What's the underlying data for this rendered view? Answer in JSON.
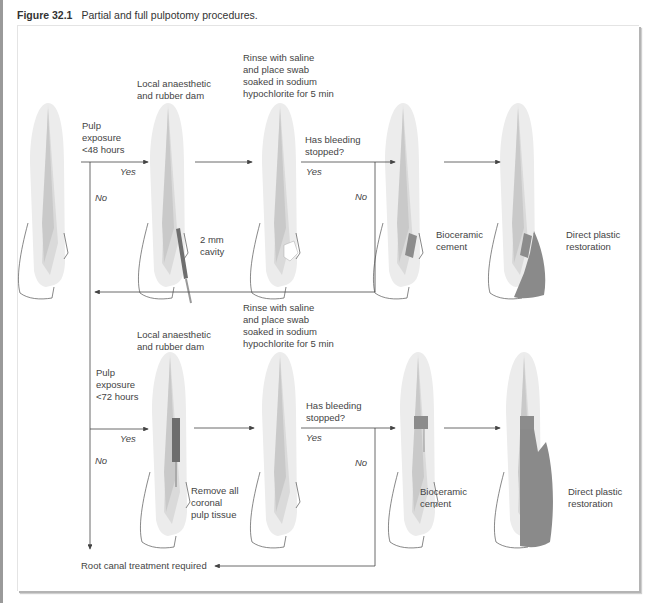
{
  "caption": {
    "figure_number": "Figure 32.1",
    "title": "Partial and full pulpotomy procedures."
  },
  "colors": {
    "enamel": "#ececec",
    "dentine": "#dadada",
    "pulp": "#c6c6c6",
    "bioceramic": "#8c8c8c",
    "restoration": "#8a8a8a",
    "line": "#555555"
  },
  "row1": {
    "start_label": "Pulp\nexposure\n<48 hours",
    "yes_1": "Yes",
    "no_1": "No",
    "step1_label": "Local anaesthetic\nand rubber dam",
    "cavity_label": "2 mm\ncavity",
    "step2_label": "Rinse with saline\nand place swab\nsoaked in sodium\nhypochlorite for 5 min",
    "question": "Has bleeding\nstopped?",
    "yes_2": "Yes",
    "no_2": "No",
    "cement_label": "Bioceramic\ncement",
    "restoration_label": "Direct plastic\nrestoration"
  },
  "row2": {
    "start_label": "Pulp\nexposure\n<72 hours",
    "yes_1": "Yes",
    "no_1": "No",
    "step1_label": "Local anaesthetic\nand rubber dam",
    "remove_label": "Remove all\ncoronal\npulp tissue",
    "step2_label": "Rinse with saline\nand place swab\nsoaked in sodium\nhypochlorite for 5 min",
    "question": "Has bleeding\nstopped?",
    "yes_2": "Yes",
    "no_2": "No",
    "cement_label": "Bioceramic\ncement",
    "restoration_label": "Direct plastic\nrestoration"
  },
  "outcome": {
    "root_canal_label": "Root canal treatment required"
  }
}
